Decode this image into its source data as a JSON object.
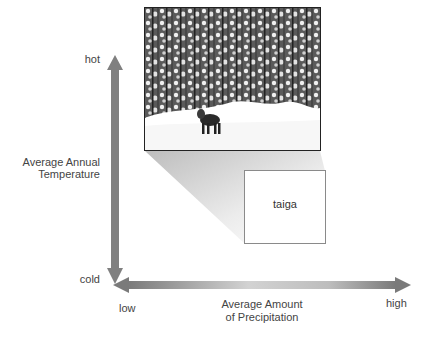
{
  "diagram": {
    "y_axis": {
      "title_line1": "Average Annual",
      "title_line2": "Temperature",
      "top_label": "hot",
      "bottom_label": "cold",
      "color": "#808080"
    },
    "x_axis": {
      "title_line1": "Average Amount",
      "title_line2": "of Precipitation",
      "left_label": "low",
      "right_label": "high",
      "end_color": "#777777",
      "mid_color": "#cfcfcf"
    },
    "biome_box": {
      "label": "taiga"
    },
    "photo": {
      "subject": "snowy conifer forest with moose"
    }
  }
}
